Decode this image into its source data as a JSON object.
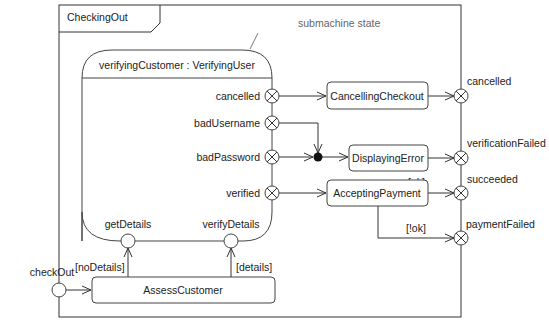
{
  "diagram": {
    "type": "UML state machine diagram",
    "frame": {
      "title": "CheckingOut"
    },
    "note": {
      "text": "submachine state"
    },
    "submachine": {
      "name": "verifyingCustomer : VerifyingUser",
      "exit_points": [
        {
          "id": "cancelled",
          "label": "cancelled"
        },
        {
          "id": "badUsername",
          "label": "badUsername"
        },
        {
          "id": "badPassword",
          "label": "badPassword"
        },
        {
          "id": "verified",
          "label": "verified"
        }
      ],
      "entry_points": [
        {
          "id": "getDetails",
          "label": "getDetails"
        },
        {
          "id": "verifyDetails",
          "label": "verifyDetails"
        }
      ]
    },
    "states": [
      {
        "id": "cancellingCheckout",
        "label": "CancellingCheckout"
      },
      {
        "id": "displayingError",
        "label": "DisplayingError"
      },
      {
        "id": "acceptingPayment",
        "label": "AcceptingPayment"
      },
      {
        "id": "assessCustomer",
        "label": "AssessCustomer"
      }
    ],
    "frame_entry_points": [
      {
        "id": "checkOut",
        "label": "checkOut"
      }
    ],
    "frame_exit_points": [
      {
        "id": "cancelled",
        "label": "cancelled"
      },
      {
        "id": "verificationFailed",
        "label": "verificationFailed"
      },
      {
        "id": "succeeded",
        "label": "succeeded"
      },
      {
        "id": "paymentFailed",
        "label": "paymentFailed"
      }
    ],
    "guards": {
      "noDetails": "[noDetails]",
      "details": "[details]",
      "ok": "[ok]",
      "notOk": "[!ok]"
    },
    "transitions": [
      {
        "from": "checkOut",
        "to": "assessCustomer",
        "guard": ""
      },
      {
        "from": "assessCustomer",
        "to": "getDetails",
        "guard": "[noDetails]"
      },
      {
        "from": "assessCustomer",
        "to": "verifyDetails",
        "guard": "[details]"
      },
      {
        "from": "cancelled",
        "to": "cancellingCheckout",
        "guard": ""
      },
      {
        "from": "badUsername",
        "to": "junction",
        "guard": ""
      },
      {
        "from": "badPassword",
        "to": "junction",
        "guard": ""
      },
      {
        "from": "junction",
        "to": "displayingError",
        "guard": ""
      },
      {
        "from": "verified",
        "to": "acceptingPayment",
        "guard": ""
      },
      {
        "from": "cancellingCheckout",
        "to": "frame.cancelled",
        "guard": ""
      },
      {
        "from": "displayingError",
        "to": "frame.verificationFailed",
        "guard": ""
      },
      {
        "from": "acceptingPayment",
        "to": "frame.succeeded",
        "guard": "[ok]"
      },
      {
        "from": "acceptingPayment",
        "to": "frame.paymentFailed",
        "guard": "[!ok]"
      }
    ]
  }
}
